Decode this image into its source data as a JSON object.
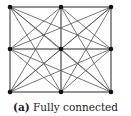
{
  "figure": {
    "type": "graph",
    "topology": "fully connected 3x3 grid",
    "nodes": [
      {
        "id": 0,
        "x": 10,
        "y": 7
      },
      {
        "id": 1,
        "x": 61,
        "y": 7
      },
      {
        "id": 2,
        "x": 111,
        "y": 7
      },
      {
        "id": 3,
        "x": 10,
        "y": 49
      },
      {
        "id": 4,
        "x": 61,
        "y": 49
      },
      {
        "id": 5,
        "x": 111,
        "y": 49
      },
      {
        "id": 6,
        "x": 10,
        "y": 92
      },
      {
        "id": 7,
        "x": 61,
        "y": 92
      },
      {
        "id": 8,
        "x": 111,
        "y": 92
      }
    ],
    "node_color": "#111111",
    "edge_color": "#555555"
  },
  "caption": {
    "label": "(a)",
    "text": "Fully connected"
  }
}
